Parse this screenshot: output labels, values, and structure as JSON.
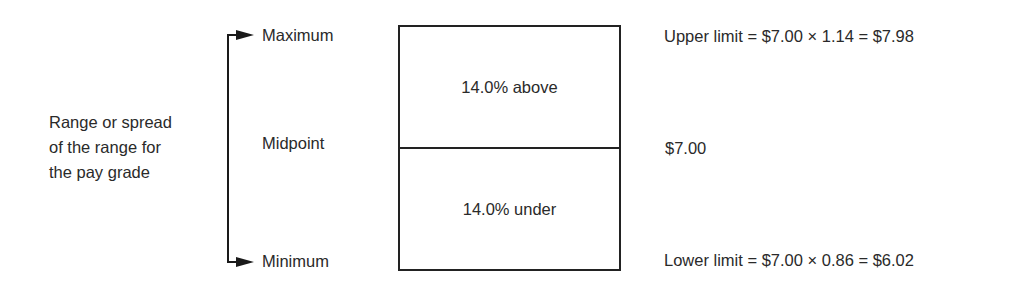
{
  "diagram": {
    "range_label": "Range or spread\nof the range for\nthe pay grade",
    "levels": {
      "maximum": "Maximum",
      "midpoint": "Midpoint",
      "minimum": "Minimum"
    },
    "box": {
      "upper": "14.0% above",
      "lower": "14.0% under"
    },
    "values": {
      "upper_limit": "Upper limit = $7.00 × 1.14 = $7.98",
      "midpoint": "$7.00",
      "lower_limit": "Lower limit = $7.00 × 0.86 = $6.02"
    },
    "colors": {
      "line": "#222222",
      "text": "#2a2a2a"
    }
  }
}
